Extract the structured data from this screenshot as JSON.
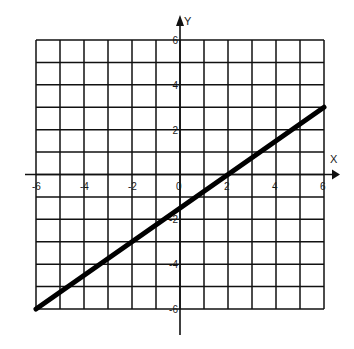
{
  "chart_data": {
    "type": "line",
    "title": "",
    "xlabel": "X",
    "ylabel": "Y",
    "xlim": [
      -6,
      6
    ],
    "ylim": [
      -6,
      6
    ],
    "grid": true,
    "grid_step": 1,
    "x_tick_labels": [
      "-6",
      "-4",
      "-2",
      "0",
      "2",
      "4",
      "6"
    ],
    "y_tick_labels": [
      "6",
      "4",
      "2",
      "-2",
      "-4",
      "-6"
    ],
    "series": [
      {
        "name": "line",
        "equation": "y = 0.75x - 1.5",
        "x": [
          -6,
          6
        ],
        "y": [
          -6,
          3
        ],
        "color": "#000000"
      }
    ]
  },
  "colors": {
    "grid": "#111111",
    "line": "#000000",
    "background": "#ffffff"
  }
}
